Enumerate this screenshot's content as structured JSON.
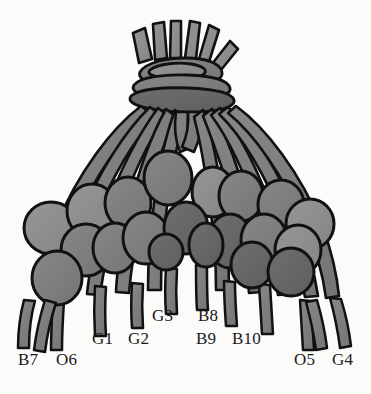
{
  "figure": {
    "kind": "quipu-drawing",
    "background_color": "#fbfbfa",
    "ink_color": "#111111",
    "fill_light": "#8d8d8d",
    "fill_mid": "#7c7c7c",
    "fill_dark": "#666666",
    "width": 371,
    "height": 394
  },
  "labels": [
    {
      "id": "B7",
      "text": "B7",
      "x": 18,
      "y": 351
    },
    {
      "id": "O6",
      "text": "O6",
      "x": 56,
      "y": 351
    },
    {
      "id": "G1",
      "text": "G1",
      "x": 92,
      "y": 330
    },
    {
      "id": "G2",
      "text": "G2",
      "x": 128,
      "y": 330
    },
    {
      "id": "G3",
      "text": "G3",
      "x": 152,
      "y": 307
    },
    {
      "id": "B8",
      "text": "B8",
      "x": 198,
      "y": 307
    },
    {
      "id": "B9",
      "text": "B9",
      "x": 196,
      "y": 330
    },
    {
      "id": "B10",
      "text": "B10",
      "x": 232,
      "y": 330
    },
    {
      "id": "O5",
      "text": "O5",
      "x": 294,
      "y": 351
    },
    {
      "id": "G4",
      "text": "G4",
      "x": 332,
      "y": 351
    }
  ],
  "structure": {
    "top_bundle": {
      "tuft_count": 6,
      "collar_band_count": 3
    },
    "pendant_cords": 14,
    "knot_ovals": 26
  }
}
